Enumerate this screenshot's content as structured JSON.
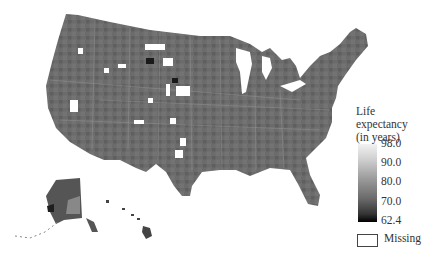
{
  "figure": {
    "type": "choropleth",
    "colormap": "grayscale"
  },
  "legend": {
    "title_line1": "Life expectancy",
    "title_line2": "(in years)",
    "ticks": [
      "98.0",
      "90.0",
      "80.0",
      "70.0",
      "62.4"
    ],
    "min": 62.4,
    "max": 98.0,
    "missing_label": "Missing",
    "colors": {
      "high": "#f2f2f2",
      "mid": "#8a8a8a",
      "low": "#000000",
      "missing": "#ffffff"
    }
  }
}
